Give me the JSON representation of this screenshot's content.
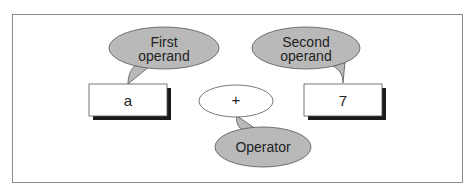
{
  "diagram": {
    "callouts": {
      "first_operand": {
        "line1": "First",
        "line2": "operand"
      },
      "second_operand": {
        "line1": "Second",
        "line2": "operand"
      },
      "operator": "Operator"
    },
    "boxes": {
      "left_operand": "a",
      "operator": "+",
      "right_operand": "7"
    },
    "colors": {
      "callout_fill": "#b9b9b9",
      "frame_border": "#8a8a8a",
      "shadow": "#1a1a1a"
    }
  }
}
